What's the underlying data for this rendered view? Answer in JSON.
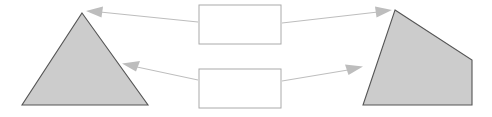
{
  "diagram": {
    "title": "",
    "background_color": "#ffffff",
    "shape_fill_color": "#cccccc",
    "shape_stroke_color": "#555555",
    "box_fill_color": "#ffffff",
    "box_stroke_color": "#aaaaaa",
    "arrow_color": "#bdbdbd",
    "shapes": [
      {
        "name": "triangle",
        "label": "",
        "points": "82,13 148,105 22,105"
      },
      {
        "name": "quadrilateral",
        "label": "",
        "points": "395,10 472,60 472,105 363,105"
      }
    ],
    "boxes": [
      {
        "name": "top-box",
        "label": "",
        "x": 199,
        "y": 5,
        "width": 82,
        "height": 39
      },
      {
        "name": "bottom-box",
        "label": "",
        "x": 199,
        "y": 69,
        "width": 82,
        "height": 39
      }
    ],
    "arrows": [
      {
        "name": "top-box-to-triangle",
        "direction": "left",
        "from": "top-box",
        "to": "triangle"
      },
      {
        "name": "top-box-to-quadrilateral",
        "direction": "right",
        "from": "top-box",
        "to": "quadrilateral"
      },
      {
        "name": "bottom-box-to-triangle",
        "direction": "left",
        "from": "bottom-box",
        "to": "triangle"
      },
      {
        "name": "bottom-box-to-quadrilateral",
        "direction": "right",
        "from": "bottom-box",
        "to": "quadrilateral"
      }
    ]
  }
}
